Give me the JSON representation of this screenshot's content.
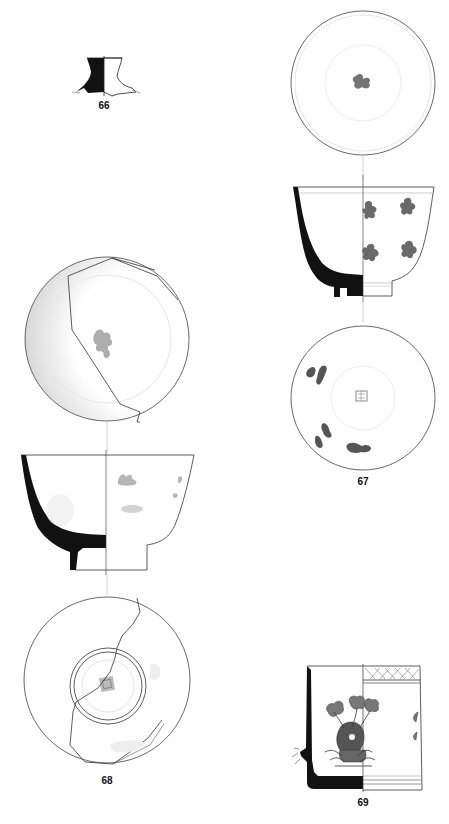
{
  "plate": {
    "background": "#ffffff",
    "ink": "#111111",
    "decoration_color": "#555555"
  },
  "figures": [
    {
      "id": "66",
      "label": "66",
      "description": "Profile of vessel foot fragment, section and exterior elevation"
    },
    {
      "id": "67",
      "label": "67",
      "description": "Cup with flaring rim: interior view, profile/elevation with floral sprays, and base view with central mark"
    },
    {
      "id": "68",
      "label": "68",
      "description": "Bowl: interior view with central floral motif, profile/elevation, base view with square mark inside footring"
    },
    {
      "id": "69",
      "label": "69",
      "description": "Cylindrical vessel fragment: section and elevation with potted flower design and lattice border"
    }
  ]
}
